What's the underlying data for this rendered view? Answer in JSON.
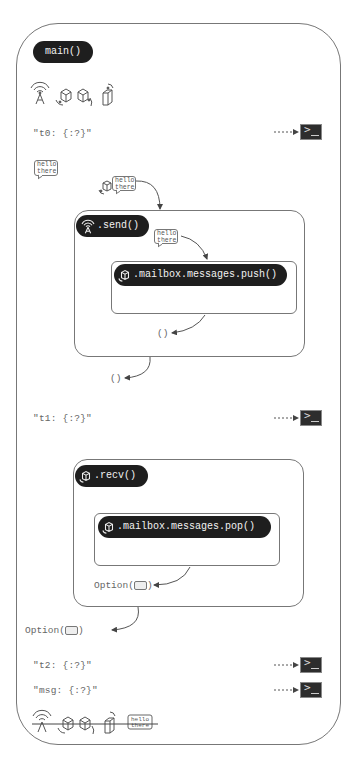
{
  "main": {
    "title": "main()",
    "strings": {
      "t0": "\"t0: {:?}\"",
      "t1": "\"t1: {:?}\"",
      "t2": "\"t2: {:?}\"",
      "msg": "\"msg: {:?}\""
    }
  },
  "message": {
    "line1": "hello",
    "line2": "there"
  },
  "send": {
    "title": ".send()",
    "inner_call": ".mailbox.messages.push()",
    "inner_return": "()",
    "outer_return": "()"
  },
  "recv": {
    "title": ".recv()",
    "inner_call": ".mailbox.messages.pop()",
    "inner_return_prefix": "Option(",
    "inner_return_suffix": ")",
    "outer_return_prefix": "Option(",
    "outer_return_suffix": ")"
  },
  "icons": {
    "top_row": [
      "antenna-icon",
      "package-move-icon",
      "package-move-icon",
      "mailbox-icon"
    ],
    "bottom_row_dropped": [
      "antenna-icon",
      "package-move-icon",
      "package-move-icon",
      "mailbox-icon",
      "message-bubble-icon"
    ],
    "terminal": "terminal-icon"
  },
  "colors": {
    "pill_bg": "#1e1e1e",
    "pill_text": "#f2f2f2",
    "line": "#777777",
    "terminal_bg": "#2d2d2d"
  }
}
